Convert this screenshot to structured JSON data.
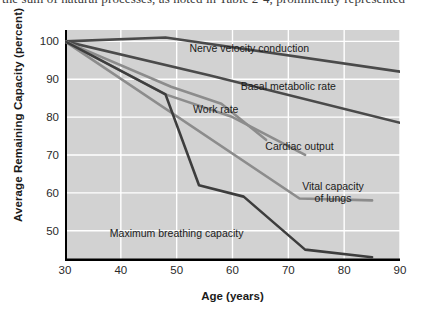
{
  "page": {
    "top_clipped_text": "the sum of natural processes, as noted in Table 2-4, prominently represented"
  },
  "figure": {
    "y_axis_title": "Average Remaining Capacity (percent)",
    "x_axis_title": "Age (years)",
    "plot_background": "#d2d2d2",
    "grid_color": "#ffffff"
  },
  "chart_data": {
    "type": "line",
    "title": "",
    "xlabel": "Age (years)",
    "ylabel": "Average Remaining Capacity (percent)",
    "xlim": [
      30,
      90
    ],
    "ylim": [
      42,
      103
    ],
    "xticks": [
      30,
      40,
      50,
      60,
      70,
      80,
      90
    ],
    "yticks": [
      50,
      60,
      70,
      80,
      90,
      100
    ],
    "grid": true,
    "legend": "inline-labels",
    "series": [
      {
        "name": "Nerve velocity conduction",
        "color": "#4a4a4a",
        "label_x": 63,
        "label_y": 98,
        "x": [
          30,
          48,
          90
        ],
        "y": [
          100,
          101,
          92
        ]
      },
      {
        "name": "Basal metabolic rate",
        "color": "#4a4a4a",
        "label_x": 70,
        "label_y": 88,
        "x": [
          30,
          56,
          90
        ],
        "y": [
          100,
          91,
          78.5
        ]
      },
      {
        "name": "Work rate",
        "color": "#8c8c8c",
        "label_x": 57,
        "label_y": 82,
        "x": [
          30,
          49,
          58,
          66
        ],
        "y": [
          100,
          88,
          83.5,
          74
        ]
      },
      {
        "name": "Cardiac output",
        "color": "#8c8c8c",
        "label_x": 72,
        "label_y": 72,
        "x": [
          30,
          48,
          60,
          73
        ],
        "y": [
          100,
          86,
          80,
          70
        ]
      },
      {
        "name": "Vital capacity of lungs",
        "color": "#8c8c8c",
        "label_x": 78,
        "label_y": 60,
        "x": [
          30,
          72,
          85
        ],
        "y": [
          100,
          58.5,
          58
        ]
      },
      {
        "name": "Maximum breathing capacity",
        "color": "#3d3d3d",
        "label_x": 50,
        "label_y": 49,
        "x": [
          30,
          48,
          54,
          62,
          73,
          85
        ],
        "y": [
          100,
          86,
          62,
          59,
          45,
          43
        ]
      }
    ]
  }
}
